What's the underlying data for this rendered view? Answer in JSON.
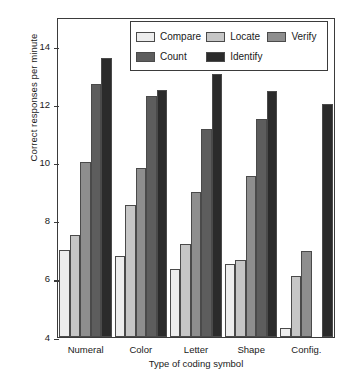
{
  "chart_data": {
    "type": "bar",
    "title": "",
    "xlabel": "Type of coding symbol",
    "ylabel": "Correct responses per minute",
    "categories": [
      "Numeral",
      "Color",
      "Letter",
      "Shape",
      "Config."
    ],
    "ylim": [
      4,
      15
    ],
    "yticks": [
      4,
      6,
      8,
      10,
      12,
      14
    ],
    "ytick_labels": [
      "4",
      "6",
      "8",
      "10",
      "12",
      "14"
    ],
    "grid": false,
    "legend_position": "top-center-inside",
    "series": [
      {
        "name": "Compare",
        "color": "#ededed",
        "values": [
          7.0,
          6.8,
          6.35,
          6.5,
          4.3
        ]
      },
      {
        "name": "Locate",
        "color": "#c6c6c6",
        "values": [
          7.5,
          8.55,
          7.2,
          6.65,
          6.1
        ]
      },
      {
        "name": "Verify",
        "color": "#8e8e8e",
        "values": [
          10.0,
          9.8,
          9.0,
          9.55,
          6.95
        ]
      },
      {
        "name": "Count",
        "color": "#5d5d5d",
        "values": [
          12.7,
          12.3,
          11.15,
          11.5,
          0
        ]
      },
      {
        "name": "Identify",
        "color": "#2b2b2b",
        "values": [
          13.6,
          12.5,
          13.05,
          12.45,
          12.0
        ]
      }
    ]
  },
  "legend": {
    "entries": [
      {
        "label": "Compare",
        "swatch": "#ededed"
      },
      {
        "label": "Locate",
        "swatch": "#c6c6c6"
      },
      {
        "label": "Verify",
        "swatch": "#8e8e8e"
      },
      {
        "label": "Count",
        "swatch": "#5d5d5d"
      },
      {
        "label": "Identify",
        "swatch": "#2b2b2b"
      }
    ]
  }
}
